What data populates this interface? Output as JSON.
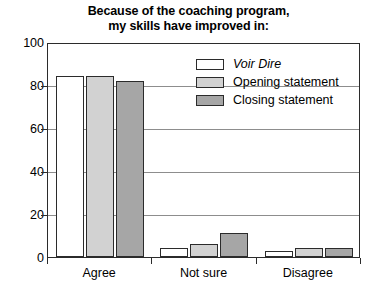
{
  "chart_data": {
    "type": "bar",
    "title": "Because of the coaching program, my skills have improved in:",
    "title_lines": [
      "Because of the coaching program,",
      "my skills have improved in:"
    ],
    "categories": [
      "Agree",
      "Not sure",
      "Disagree"
    ],
    "series": [
      {
        "name": "Voir Dire",
        "values": [
          84,
          4,
          3
        ],
        "color": "#ffffff",
        "italic": true
      },
      {
        "name": "Opening statement",
        "values": [
          84,
          6,
          4
        ],
        "color": "#d2d2d2",
        "italic": false
      },
      {
        "name": "Closing statement",
        "values": [
          82,
          11,
          4
        ],
        "color": "#a6a6a6",
        "italic": false
      }
    ],
    "xlabel": "",
    "ylabel": "",
    "ylim": [
      0,
      100
    ],
    "yticks": [
      0,
      20,
      40,
      60,
      80,
      100
    ],
    "ytick_labels": [
      "0",
      "20",
      "40",
      "60",
      "80",
      "100"
    ],
    "grid": true,
    "grid_axis": "y",
    "legend_position": "upper right inside plot",
    "border_color": "#2b2b2b",
    "grid_color": "#8d8d8d",
    "background": "#ffffff"
  }
}
